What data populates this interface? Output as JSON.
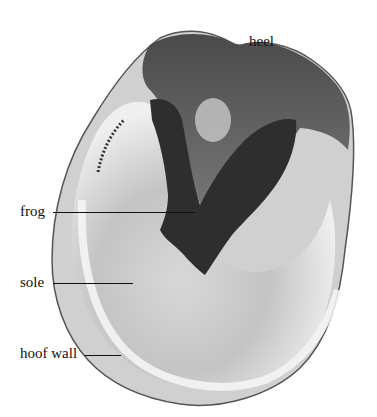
{
  "figure": {
    "labels": [
      {
        "id": "heel",
        "text": "heel"
      },
      {
        "id": "frog",
        "text": "frog"
      },
      {
        "id": "sole",
        "text": "sole"
      },
      {
        "id": "hoof_wall",
        "text": "hoof wall"
      }
    ]
  },
  "colors": {
    "background": "#ffffff",
    "hoof_dark": "#3a3a3a",
    "hoof_mid": "#8a8a8a",
    "hoof_light": "#e6e6e6",
    "label_text": "#111111"
  }
}
